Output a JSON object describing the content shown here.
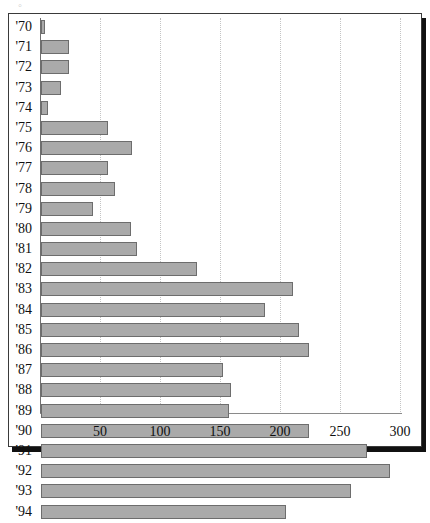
{
  "figure": {
    "smudge_glyph": "◦"
  },
  "chart_data": {
    "type": "bar",
    "orientation": "horizontal",
    "title": "",
    "subtitle": "",
    "xlabel": "",
    "ylabel": "",
    "xlim": [
      0,
      300
    ],
    "ylim": null,
    "grid": true,
    "legend": null,
    "xticks": [
      50,
      100,
      150,
      200,
      250,
      300
    ],
    "xtick_labels": [
      "50",
      "100",
      "150",
      "200",
      "250",
      "300"
    ],
    "categories": [
      "'70",
      "'71",
      "'72",
      "'73",
      "'74",
      "'75",
      "'76",
      "'77",
      "'78",
      "'79",
      "'80",
      "'81",
      "'82",
      "'83",
      "'84",
      "'85",
      "'86",
      "'87",
      "'88",
      "'89",
      "'90",
      "'91",
      "'92",
      "'93",
      "'94"
    ],
    "values": [
      3,
      23,
      23,
      17,
      6,
      56,
      76,
      56,
      62,
      43,
      75,
      80,
      130,
      210,
      187,
      215,
      223,
      152,
      158,
      157,
      223,
      272,
      291,
      258,
      204
    ],
    "bar_color": "#aaaaaa",
    "bar_edge_color": "#6d6d6d",
    "gridline_color": "#c4c4c4",
    "axis_color": "#6f6f6f",
    "background_color": "#ffffff"
  }
}
